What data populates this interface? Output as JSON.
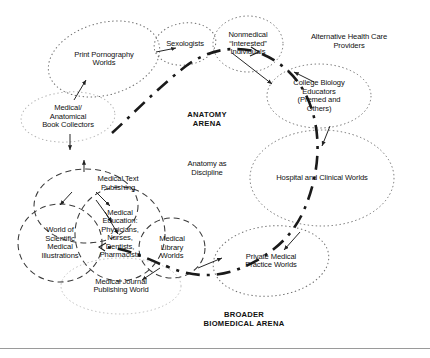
{
  "figure": {
    "arena_labels": {
      "anatomy_arena": "ANATOMY\nARENA",
      "anatomy_as_discipline": "Anatomy as\nDiscipline",
      "broader_biomedical_arena": "BROADER\nBIOMEDICAL ARENA"
    },
    "worlds": [
      {
        "id": "print-pornography-worlds",
        "label": "Print Pornography\nWorlds",
        "cx": 104,
        "cy": 59,
        "rx": 57,
        "ry": 36,
        "rot": -16,
        "style": "dotted",
        "color": "#6d6d6d"
      },
      {
        "id": "sexologists",
        "label": "Sexologists",
        "cx": 185,
        "cy": 44,
        "rx": 31,
        "ry": 21,
        "rot": -8,
        "style": "dotted",
        "color": "#6d6d6d"
      },
      {
        "id": "nonmedical-interested-individuals",
        "label": "Nonmedical\n“Interested”\nIndividuals",
        "cx": 248,
        "cy": 44,
        "rx": 35,
        "ry": 28,
        "rot": 0,
        "style": "dotted",
        "color": "#6d6d6d"
      },
      {
        "id": "college-biology-educators",
        "label": "College Biology\nEducators\n(Premed and\nOthers)",
        "cx": 319,
        "cy": 96,
        "rx": 52,
        "ry": 32,
        "rot": 0,
        "style": "dotted",
        "color": "#6d6d6d"
      },
      {
        "id": "hospital-and-clinical-worlds",
        "label": "Hospital and Clinical Worlds",
        "cx": 322,
        "cy": 178,
        "rx": 72,
        "ry": 48,
        "rot": 0,
        "style": "dotted",
        "color": "#6d6d6d"
      },
      {
        "id": "private-medical-practice-worlds",
        "label": "Private Medical\nPractice Worlds",
        "cx": 271,
        "cy": 261,
        "rx": 58,
        "ry": 35,
        "rot": -6,
        "style": "dotted",
        "color": "#6d6d6d"
      },
      {
        "id": "medical-anatomical-book-collectors",
        "label": "Medical/\nAnatomical\nBook Collectors",
        "cx": 68,
        "cy": 117,
        "rx": 47,
        "ry": 25,
        "rot": -4,
        "style": "dotted",
        "color": "#b4b4b4"
      },
      {
        "id": "medical-text-publishing-world",
        "label": "",
        "cx": 86,
        "cy": 206,
        "rx": 52,
        "ry": 37,
        "rot": 0,
        "style": "dashed",
        "color": "#3a3a3a"
      },
      {
        "id": "world-of-scientific-medical-illustrations",
        "label": "World of\nScientific\nMedical\nIllustrations",
        "cx": 60,
        "cy": 243,
        "rx": 42,
        "ry": 39,
        "rot": 0,
        "style": "dashed",
        "color": "#3a3a3a"
      },
      {
        "id": "medical-education-world",
        "label": "Medical\nEducation:\nPhysicians,\nNurses,\nDentists,\nPharmacists",
        "cx": 120,
        "cy": 234,
        "rx": 45,
        "ry": 47,
        "rot": 0,
        "style": "dashed",
        "color": "#3a3a3a"
      },
      {
        "id": "medical-library-worlds",
        "label": "Medical\nLibrary\nWorlds",
        "cx": 172,
        "cy": 248,
        "rx": 33,
        "ry": 30,
        "rot": 0,
        "style": "dashed",
        "color": "#3a3a3a"
      },
      {
        "id": "medical-journal-publishing-world",
        "label": "Medical Journal\nPublishing World",
        "cx": 121,
        "cy": 286,
        "rx": 60,
        "ry": 28,
        "rot": 0,
        "style": "dotted",
        "color": "#bdbdbd"
      }
    ],
    "plain_labels": [
      {
        "id": "alternative-health-care-providers",
        "label": "Alternative Health Care\nProviders",
        "x": 294,
        "y": 33
      },
      {
        "id": "medical-text-publishing",
        "label": "Medical Text\nPublishing",
        "x": 63,
        "y": 175
      }
    ],
    "boundary_curve_name": "arena-boundary-curve"
  }
}
